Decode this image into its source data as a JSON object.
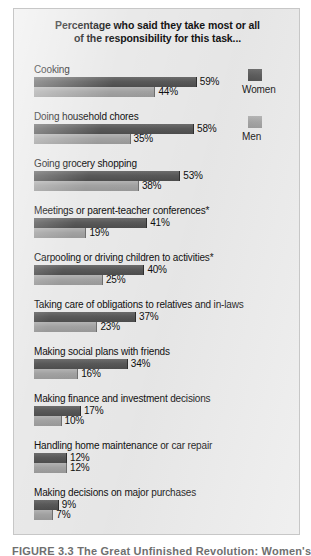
{
  "chart_data": {
    "type": "bar",
    "title": "Percentage who said they take most or all of the responsibility for this task...",
    "title_lines": [
      "Percentage who said they take most or all",
      "of the responsibility for this task..."
    ],
    "orientation": "horizontal",
    "grid": false,
    "xlabel": "",
    "ylabel": "",
    "xlim": [
      0,
      60
    ],
    "value_suffix": "%",
    "legend_position": "right",
    "categories": [
      "Cooking",
      "Doing household chores",
      "Going grocery shopping",
      "Meetings or parent-teacher conferences*",
      "Carpooling or driving children to activities*",
      "Taking care of obligations to relatives and in-laws",
      "Making social plans with friends",
      "Making finance and investment decisions",
      "Handling home maintenance or car repair",
      "Making decisions on major purchases"
    ],
    "series": [
      {
        "name": "Women",
        "color": "#585858",
        "values": [
          59,
          58,
          53,
          41,
          40,
          37,
          34,
          17,
          12,
          9
        ],
        "labels": [
          "59%",
          "58%",
          "53%",
          "41%",
          "40%",
          "37%",
          "34%",
          "17%",
          "12%",
          "9%"
        ]
      },
      {
        "name": "Men",
        "color": "#a0a0a0",
        "values": [
          44,
          35,
          38,
          19,
          25,
          23,
          16,
          10,
          12,
          7
        ],
        "labels": [
          "44%",
          "35%",
          "38%",
          "19%",
          "25%",
          "23%",
          "16%",
          "10%",
          "12%",
          "7%"
        ]
      }
    ]
  },
  "legend": {
    "items": [
      {
        "label": "Women",
        "color": "#585858"
      },
      {
        "label": "Men",
        "color": "#a0a0a0"
      }
    ]
  },
  "caption": {
    "text": "FIGURE 3.3  The Great Unfinished Revolution: Women's"
  }
}
